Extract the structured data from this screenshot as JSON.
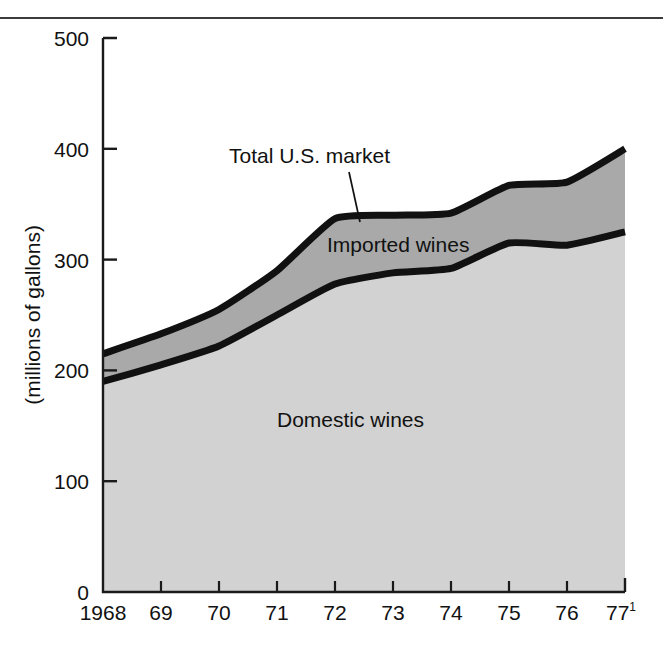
{
  "figure": {
    "cut_title": "wine consumption",
    "axis": {
      "y_label": "(millions of gallons)",
      "y_ticks": [
        "0",
        "100",
        "200",
        "300",
        "400",
        "500"
      ],
      "x_ticks": [
        "1968",
        "69",
        "70",
        "71",
        "72",
        "73",
        "74",
        "75",
        "76",
        "77"
      ],
      "x_last_superscript": "1"
    },
    "annotations": {
      "total": "Total U.S. market",
      "imported": "Imported wines",
      "domestic": "Domestic wines"
    },
    "colors": {
      "imported_fill": "#a9a9a9",
      "domestic_fill": "#d2d2d2",
      "curve_stroke": "#111111",
      "axis_stroke": "#1a1a1a",
      "rule": "#3b3b3b"
    }
  },
  "chart_data": {
    "type": "area",
    "title": "wine consumption",
    "subtitle": "",
    "xlabel": "",
    "ylabel": "(millions of gallons)",
    "xlim": [
      1968,
      1977
    ],
    "ylim": [
      0,
      500
    ],
    "y_ticks": [
      0,
      100,
      200,
      300,
      400,
      500
    ],
    "grid": false,
    "legend": "inline-annotations",
    "stacked": true,
    "x": [
      1968,
      1969,
      1970,
      1971,
      1972,
      1973,
      1974,
      1975,
      1976,
      1977
    ],
    "x_tick_labels": [
      "1968",
      "69",
      "70",
      "71",
      "72",
      "73",
      "74",
      "75",
      "76",
      "77"
    ],
    "series": [
      {
        "name": "Domestic wines",
        "values": [
          190,
          205,
          222,
          250,
          278,
          288,
          292,
          315,
          313,
          325
        ]
      },
      {
        "name": "Imported wines",
        "note": "band between Domestic wines and Total U.S. market",
        "values": [
          25,
          28,
          33,
          40,
          59,
          52,
          50,
          52,
          57,
          75
        ]
      },
      {
        "name": "Total U.S. market",
        "values": [
          215,
          233,
          255,
          290,
          337,
          340,
          342,
          367,
          370,
          400
        ]
      }
    ],
    "annotations": [
      {
        "text": "Total U.S. market",
        "points_to": "top boundary curve at 1972"
      },
      {
        "text": "Imported wines",
        "points_to": "middle band"
      },
      {
        "text": "Domestic wines",
        "points_to": "lower area"
      }
    ],
    "footnote_marker": "1"
  }
}
